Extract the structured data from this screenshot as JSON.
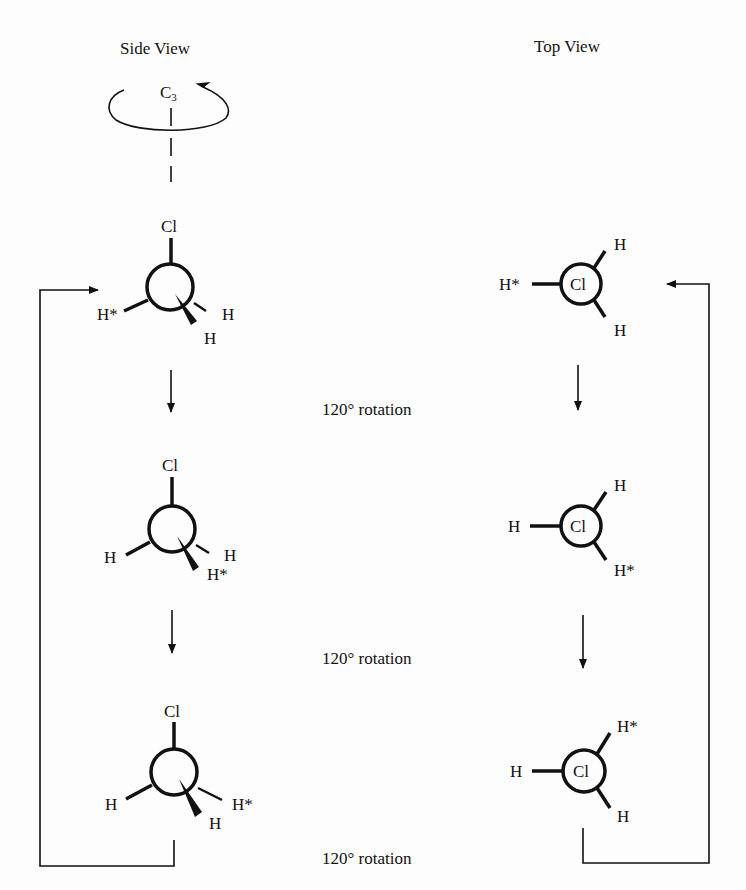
{
  "headings": {
    "side_view": "Side View",
    "top_view": "Top View"
  },
  "axis": {
    "label": "C",
    "subscript": "3"
  },
  "rotation_labels": [
    "120° rotation",
    "120° rotation",
    "120° rotation"
  ],
  "side_view": [
    {
      "top": "Cl",
      "left": "H*",
      "right_dash": "H",
      "bottom_wedge": "H"
    },
    {
      "top": "Cl",
      "left": "H",
      "right_dash": "H",
      "bottom_wedge": "H*"
    },
    {
      "top": "Cl",
      "left": "H",
      "right_dash": "H*",
      "bottom_wedge": "H"
    }
  ],
  "top_view": [
    {
      "center": "Cl",
      "left": "H*",
      "upper_right": "H",
      "lower_right": "H"
    },
    {
      "center": "Cl",
      "left": "H",
      "upper_right": "H",
      "lower_right": "H*"
    },
    {
      "center": "Cl",
      "left": "H",
      "upper_right": "H*",
      "lower_right": "H"
    }
  ]
}
